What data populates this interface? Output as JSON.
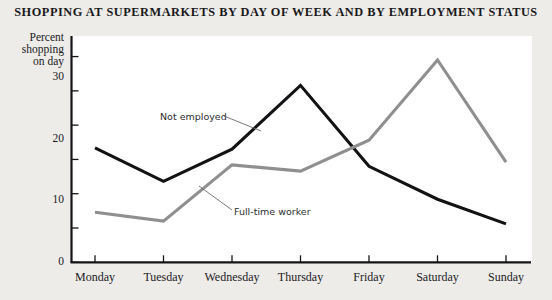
{
  "chart_data": {
    "type": "line",
    "title": "SHOPPING AT SUPERMARKETS BY DAY OF WEEK AND BY EMPLOYMENT STATUS",
    "xlabel": "",
    "ylabel": "Percent shopping on day",
    "ylabel_lines": [
      "Percent",
      "shopping",
      "on day"
    ],
    "categories": [
      "Monday",
      "Tuesday",
      "Wednesday",
      "Thursday",
      "Friday",
      "Saturday",
      "Sunday"
    ],
    "ylim": [
      0,
      33
    ],
    "yticks_major": [
      0,
      10,
      20,
      30
    ],
    "yticks_minor": [
      5,
      15,
      25
    ],
    "ytick_labels": [
      "0",
      "10",
      "20",
      "30"
    ],
    "grid": false,
    "legend_position": "inline-annotations",
    "series": [
      {
        "name": "Not employed",
        "color": "#121214",
        "values": [
          16.7,
          11.8,
          16.5,
          25.8,
          14.0,
          9.2,
          5.6
        ]
      },
      {
        "name": "Full-time worker",
        "color": "#8f8f8f",
        "values": [
          7.3,
          6.0,
          14.2,
          13.3,
          17.8,
          29.5,
          14.6
        ]
      }
    ],
    "annotations": [
      {
        "text": "Not employed",
        "series": "Not employed"
      },
      {
        "text": "Full-time worker",
        "series": "Full-time worker"
      }
    ]
  },
  "colors": {
    "background": "#edece9",
    "plot_background": "#ffffff",
    "axis": "#151416",
    "not_employed": "#121214",
    "full_time_worker": "#8f8f8f",
    "leader_line": "#6b6a6c"
  }
}
